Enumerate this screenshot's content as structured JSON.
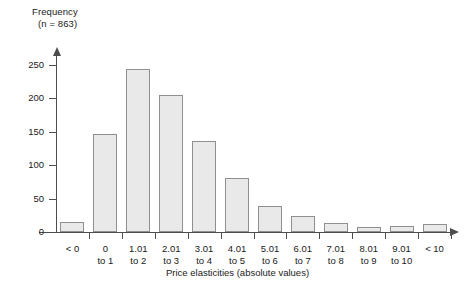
{
  "chart_data": {
    "type": "bar",
    "title": "Frequency",
    "subtitle": "(n = 863)",
    "xlabel": "Price elasticities (absolute values)",
    "ylabel": "Frequency",
    "grid": false,
    "legend": null,
    "ylim": [
      0,
      265
    ],
    "yticks": [
      0,
      50,
      100,
      150,
      200,
      250
    ],
    "categories": [
      "< 0",
      "0 to 1",
      "1.01 to 2",
      "2.01 to 3",
      "3.01 to 4",
      "4.01 to 5",
      "5.01 to 6",
      "6.01 to 7",
      "7.01 to 8",
      "8.01 to 9",
      "9.01 to 10",
      "< 10"
    ],
    "category_lines": [
      [
        "< 0",
        ""
      ],
      [
        "0",
        "to 1"
      ],
      [
        "1.01",
        "to 2"
      ],
      [
        "2.01",
        "to 3"
      ],
      [
        "3.01",
        "to 4"
      ],
      [
        "4.01",
        "to 5"
      ],
      [
        "5.01",
        "to 6"
      ],
      [
        "6.01",
        "to 7"
      ],
      [
        "7.01",
        "to 8"
      ],
      [
        "8.01",
        "to 9"
      ],
      [
        "9.01",
        "to 10"
      ],
      [
        "< 10",
        ""
      ]
    ],
    "values": [
      15,
      146,
      244,
      205,
      137,
      81,
      39,
      24,
      14,
      7,
      9,
      12
    ],
    "bar_fill": "#e9e9e9",
    "bar_border": "#8f8f8f",
    "axis_color": "#4d4d4d",
    "n": 863
  },
  "axis_title_y": {
    "line1": "Frequency",
    "line2": "(n = 863)"
  }
}
